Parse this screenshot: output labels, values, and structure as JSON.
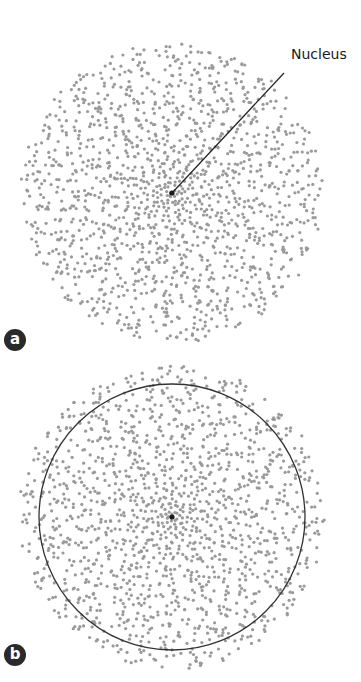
{
  "figure": {
    "panel_a": {
      "badge": "a",
      "nucleus_label": "Nucleus",
      "description": "Electron cloud as dot density with nucleus at center"
    },
    "panel_b": {
      "badge": "b",
      "description": "Electron cloud with boundary circle enclosing most probability density"
    }
  },
  "colors": {
    "dot": "#9a9a9a",
    "nucleus": "#1a1a1a",
    "line": "#222222",
    "badge_bg": "#2a2a2a",
    "badge_text": "#ffffff"
  }
}
